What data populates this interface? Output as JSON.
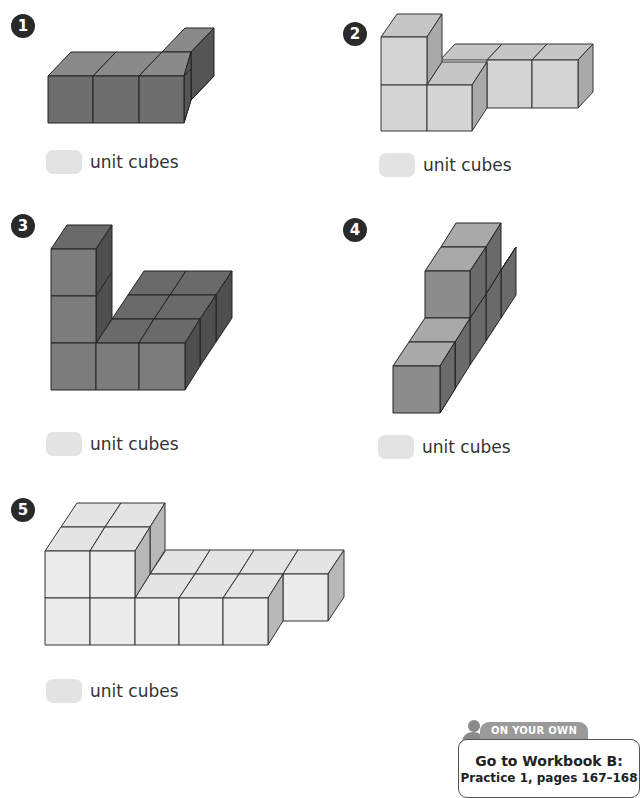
{
  "exercises": [
    {
      "number": "1",
      "answer_label": "unit cubes",
      "cube_color": "dark",
      "cube_count_shown": 4
    },
    {
      "number": "2",
      "answer_label": "unit cubes",
      "cube_color": "light",
      "cube_count_shown": 6
    },
    {
      "number": "3",
      "answer_label": "unit cubes",
      "cube_color": "dark",
      "cube_count_shown": 9
    },
    {
      "number": "4",
      "answer_label": "unit cubes",
      "cube_color": "medium",
      "cube_count_shown": 6
    },
    {
      "number": "5",
      "answer_label": "unit cubes",
      "cube_color": "lightest",
      "cube_count_shown": 13
    }
  ],
  "on_your_own": {
    "tab_label": "ON YOUR OWN",
    "line1": "Go to Workbook B:",
    "line2": "Practice 1, pages 167–168"
  },
  "colors": {
    "dark_front": "#6e6e6e",
    "dark_top": "#8a8a8a",
    "dark_side": "#555555",
    "mid_front": "#8c8c8c",
    "mid_top": "#a9a9a9",
    "mid_side": "#707070",
    "light_front": "#d4d4d4",
    "light_top": "#c6c6c6",
    "light_side": "#a9a9a9",
    "lightest_front": "#ececec",
    "lightest_top": "#e4e4e4",
    "lightest_side": "#b8b8b8",
    "answer_box": "#e3e3e3"
  }
}
